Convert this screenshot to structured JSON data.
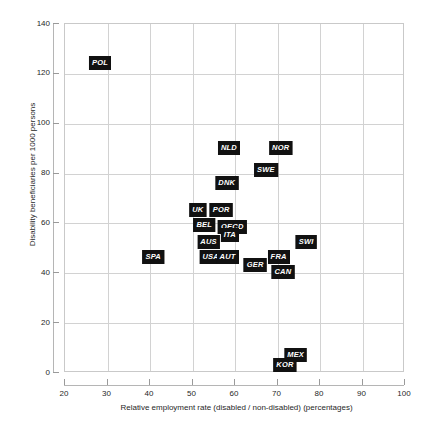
{
  "chart_data": {
    "type": "scatter",
    "title": "",
    "xlabel": "Relative employment rate (disabled / non-disabled)  (percentages)",
    "ylabel": "Disability beneficiaries per 1000 persons",
    "xlim": [
      20,
      100
    ],
    "ylim": [
      0,
      140
    ],
    "xticks": [
      20,
      30,
      40,
      50,
      60,
      70,
      80,
      90,
      100
    ],
    "yticks": [
      0,
      20,
      40,
      60,
      80,
      100,
      120,
      140
    ],
    "grid": true,
    "legend": "none",
    "point_style": "black-box-label",
    "points": [
      {
        "label": "POL",
        "x": 28.5,
        "y": 124
      },
      {
        "label": "NLD",
        "x": 58.8,
        "y": 90
      },
      {
        "label": "NOR",
        "x": 71.0,
        "y": 90
      },
      {
        "label": "SWE",
        "x": 67.5,
        "y": 81
      },
      {
        "label": "DNK",
        "x": 58.3,
        "y": 76
      },
      {
        "label": "UK",
        "x": 51.5,
        "y": 65
      },
      {
        "label": "POR",
        "x": 57.0,
        "y": 65
      },
      {
        "label": "BEL",
        "x": 53.0,
        "y": 59
      },
      {
        "label": "OECD",
        "x": 59.6,
        "y": 58
      },
      {
        "label": "ITA",
        "x": 59.0,
        "y": 55
      },
      {
        "label": "AUS",
        "x": 54.0,
        "y": 52
      },
      {
        "label": "SWI",
        "x": 77.0,
        "y": 52
      },
      {
        "label": "SPA",
        "x": 41.0,
        "y": 46
      },
      {
        "label": "USA",
        "x": 54.5,
        "y": 46
      },
      {
        "label": "AUT",
        "x": 58.5,
        "y": 46
      },
      {
        "label": "FRA",
        "x": 70.5,
        "y": 46
      },
      {
        "label": "GER",
        "x": 65.0,
        "y": 43
      },
      {
        "label": "CAN",
        "x": 71.5,
        "y": 40
      },
      {
        "label": "MEX",
        "x": 74.5,
        "y": 7
      },
      {
        "label": "KOR",
        "x": 72.0,
        "y": 3
      }
    ]
  },
  "colors": {
    "label_background": "#111111",
    "label_text": "#ffffff",
    "grid": "#d2d2d2",
    "axis": "#b5b5b5",
    "text": "#1f1f1f",
    "background": "#ffffff"
  }
}
